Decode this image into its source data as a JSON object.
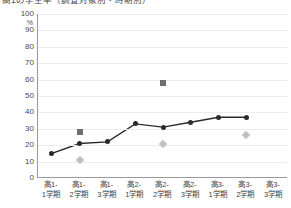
{
  "chart_title": "高1の学生率（調査対象別・時期別）",
  "y_unit": "%",
  "chart_data": {
    "type": "line",
    "title": "高1の学生率（調査対象別・時期別）",
    "xlabel": "",
    "ylabel": "%",
    "ylim": [
      0,
      100
    ],
    "ytick_step": 10,
    "yticks": [
      "0",
      "10",
      "20",
      "30",
      "40",
      "50",
      "60",
      "70",
      "80",
      "90",
      "100"
    ],
    "grid": true,
    "legend": "none",
    "categories": [
      "高1-1学期",
      "高1-2学期",
      "高1-3学期",
      "高2-1学期",
      "高2-2学期",
      "高2-3学期",
      "高3-1学期",
      "高3-2学期",
      "高3-3学期"
    ],
    "category_lines": [
      [
        "高1-",
        "1学期"
      ],
      [
        "高1-",
        "2学期"
      ],
      [
        "高1-",
        "3学期"
      ],
      [
        "高2-",
        "1学期"
      ],
      [
        "高2-",
        "2学期"
      ],
      [
        "高2-",
        "3学期"
      ],
      [
        "高3-",
        "1学期"
      ],
      [
        "高3-",
        "2学期"
      ],
      [
        "高3-",
        "3学期"
      ]
    ],
    "series": [
      {
        "name": "series-line",
        "marker": "circle",
        "color": "#2a2a2a",
        "connected": true,
        "values": [
          15,
          21,
          22,
          33,
          31,
          34,
          37,
          37,
          null
        ]
      },
      {
        "name": "series-square",
        "marker": "square",
        "color": "#6e6e6e",
        "connected": false,
        "values": [
          null,
          28,
          null,
          null,
          58,
          null,
          null,
          null,
          null
        ]
      },
      {
        "name": "series-diamond",
        "marker": "diamond",
        "color": "#c0c0c0",
        "connected": false,
        "values": [
          null,
          11,
          null,
          null,
          21,
          null,
          null,
          26,
          null
        ]
      }
    ]
  }
}
